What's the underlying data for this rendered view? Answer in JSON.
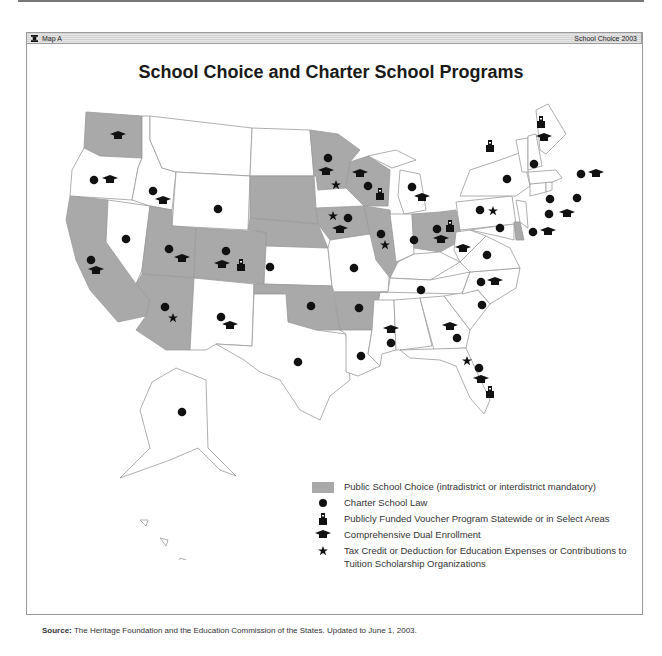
{
  "header": {
    "left_label": "Map A",
    "right_label": "School Choice 2003",
    "icon": "book-icon"
  },
  "title": "School Choice and Charter School Programs",
  "colors": {
    "public_choice_fill": "#a9a9a9",
    "state_fill": "#ffffff",
    "border": "#9a9a9a",
    "symbol": "#111111"
  },
  "legend": {
    "items": [
      {
        "symbol": "gray-swatch",
        "label": "Public School Choice (intradistrict or interdistrict mandatory)"
      },
      {
        "symbol": "dot-icon",
        "label": "Charter School Law"
      },
      {
        "symbol": "schoolhouse-icon",
        "label": "Publicly Funded Voucher Program Statewide or in Select Areas"
      },
      {
        "symbol": "graduation-cap-icon",
        "label": "Comprehensive Dual Enrollment"
      },
      {
        "symbol": "star-icon",
        "label": "Tax Credit or Deduction for Education Expenses or Contributions to Tuition Scholarship Organizations"
      }
    ]
  },
  "source": {
    "label": "Source:",
    "text": "The Heritage Foundation and the Education Commission of the States. Updated to June 1, 2003."
  },
  "states": [
    {
      "name": "Washington",
      "public_choice": true,
      "symbols": [
        "cap"
      ]
    },
    {
      "name": "Oregon",
      "public_choice": false,
      "symbols": [
        "dot",
        "cap"
      ]
    },
    {
      "name": "California",
      "public_choice": true,
      "symbols": [
        "dot",
        "cap"
      ]
    },
    {
      "name": "Nevada",
      "public_choice": false,
      "symbols": [
        "dot"
      ]
    },
    {
      "name": "Idaho",
      "public_choice": false,
      "symbols": [
        "dot",
        "cap"
      ]
    },
    {
      "name": "Montana",
      "public_choice": false,
      "symbols": []
    },
    {
      "name": "Wyoming",
      "public_choice": false,
      "symbols": [
        "dot"
      ]
    },
    {
      "name": "Utah",
      "public_choice": true,
      "symbols": [
        "dot",
        "cap"
      ]
    },
    {
      "name": "Colorado",
      "public_choice": true,
      "symbols": [
        "dot",
        "cap",
        "voucher"
      ]
    },
    {
      "name": "Arizona",
      "public_choice": true,
      "symbols": [
        "dot",
        "star"
      ]
    },
    {
      "name": "New Mexico",
      "public_choice": false,
      "symbols": [
        "dot",
        "cap"
      ]
    },
    {
      "name": "North Dakota",
      "public_choice": false,
      "symbols": []
    },
    {
      "name": "South Dakota",
      "public_choice": true,
      "symbols": []
    },
    {
      "name": "Nebraska",
      "public_choice": true,
      "symbols": []
    },
    {
      "name": "Kansas",
      "public_choice": false,
      "symbols": [
        "dot"
      ]
    },
    {
      "name": "Oklahoma",
      "public_choice": true,
      "symbols": [
        "dot"
      ]
    },
    {
      "name": "Texas",
      "public_choice": false,
      "symbols": [
        "dot"
      ]
    },
    {
      "name": "Minnesota",
      "public_choice": true,
      "symbols": [
        "dot",
        "cap",
        "star"
      ]
    },
    {
      "name": "Iowa",
      "public_choice": true,
      "symbols": [
        "star",
        "dot",
        "cap"
      ]
    },
    {
      "name": "Missouri",
      "public_choice": false,
      "symbols": [
        "dot"
      ]
    },
    {
      "name": "Arkansas",
      "public_choice": true,
      "symbols": [
        "dot"
      ]
    },
    {
      "name": "Louisiana",
      "public_choice": false,
      "symbols": [
        "dot"
      ]
    },
    {
      "name": "Wisconsin",
      "public_choice": true,
      "symbols": [
        "cap",
        "dot",
        "voucher"
      ]
    },
    {
      "name": "Illinois",
      "public_choice": true,
      "symbols": [
        "dot",
        "star"
      ]
    },
    {
      "name": "Michigan",
      "public_choice": false,
      "symbols": [
        "dot",
        "cap"
      ]
    },
    {
      "name": "Indiana",
      "public_choice": false,
      "symbols": [
        "dot"
      ]
    },
    {
      "name": "Ohio",
      "public_choice": true,
      "symbols": [
        "dot",
        "voucher",
        "cap"
      ]
    },
    {
      "name": "Kentucky",
      "public_choice": false,
      "symbols": []
    },
    {
      "name": "Tennessee",
      "public_choice": false,
      "symbols": [
        "dot"
      ]
    },
    {
      "name": "Mississippi",
      "public_choice": false,
      "symbols": [
        "cap",
        "dot"
      ]
    },
    {
      "name": "Alabama",
      "public_choice": false,
      "symbols": []
    },
    {
      "name": "Georgia",
      "public_choice": false,
      "symbols": [
        "cap",
        "dot"
      ]
    },
    {
      "name": "Florida",
      "public_choice": false,
      "symbols": [
        "star",
        "dot",
        "cap",
        "voucher"
      ]
    },
    {
      "name": "South Carolina",
      "public_choice": false,
      "symbols": [
        "dot"
      ]
    },
    {
      "name": "North Carolina",
      "public_choice": false,
      "symbols": [
        "dot",
        "cap"
      ]
    },
    {
      "name": "Virginia",
      "public_choice": false,
      "symbols": [
        "dot"
      ]
    },
    {
      "name": "West Virginia",
      "public_choice": false,
      "symbols": [
        "cap"
      ]
    },
    {
      "name": "Pennsylvania",
      "public_choice": false,
      "symbols": [
        "dot",
        "star"
      ]
    },
    {
      "name": "New York",
      "public_choice": false,
      "symbols": [
        "dot"
      ]
    },
    {
      "name": "Maryland",
      "public_choice": false,
      "symbols": [
        "dot"
      ]
    },
    {
      "name": "Delaware",
      "public_choice": true,
      "symbols": [
        "dot"
      ]
    },
    {
      "name": "New Jersey",
      "public_choice": false,
      "symbols": [
        "dot",
        "cap"
      ]
    },
    {
      "name": "Connecticut",
      "public_choice": false,
      "symbols": [
        "dot"
      ]
    },
    {
      "name": "Rhode Island",
      "public_choice": false,
      "symbols": [
        "dot"
      ]
    },
    {
      "name": "Massachusetts",
      "public_choice": false,
      "symbols": [
        "dot",
        "cap"
      ]
    },
    {
      "name": "Vermont",
      "public_choice": false,
      "symbols": [
        "voucher"
      ]
    },
    {
      "name": "New Hampshire",
      "public_choice": false,
      "symbols": [
        "dot"
      ]
    },
    {
      "name": "Maine",
      "public_choice": false,
      "symbols": [
        "voucher",
        "cap"
      ]
    },
    {
      "name": "Alaska",
      "public_choice": false,
      "symbols": [
        "dot"
      ]
    },
    {
      "name": "Hawaii",
      "public_choice": false,
      "symbols": [
        "dot"
      ]
    }
  ]
}
